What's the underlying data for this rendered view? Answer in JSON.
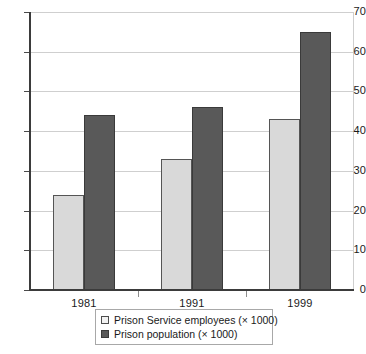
{
  "chart_data": {
    "type": "bar",
    "title": "",
    "subtitle": "",
    "xlabel": "",
    "ylabel": "",
    "categories": [
      "1981",
      "1991",
      "1999"
    ],
    "series": [
      {
        "name": "Prison Service employees (× 1000)",
        "color": "#d9d9d9",
        "values": [
          24,
          33,
          43
        ]
      },
      {
        "name": "Prison population (× 1000)",
        "color": "#595959",
        "values": [
          44,
          46,
          65
        ]
      }
    ],
    "ylim": [
      0,
      70
    ],
    "ytick_values": [
      0,
      10,
      20,
      30,
      40,
      50,
      60,
      70
    ],
    "ytick_labels": [
      "0",
      "10",
      "20",
      "30",
      "40",
      "50",
      "60",
      "70"
    ],
    "grid": true,
    "grid_axis": "y",
    "legend_position": "bottom-center",
    "annotations": []
  },
  "legend": {
    "entries": [
      {
        "label": "Prison Service employees (× 1000)",
        "swatch": "light-square-swatch"
      },
      {
        "label": "Prison population (× 1000)",
        "swatch": "dark-square-swatch"
      }
    ]
  },
  "colors": {
    "series_a": "#d9d9d9",
    "series_b": "#595959",
    "gridline": "#cfcfcf",
    "axis": "#3b3b3b",
    "text": "#1a1a1a",
    "legend_border": "#a8a8a8",
    "background": "#ffffff"
  }
}
